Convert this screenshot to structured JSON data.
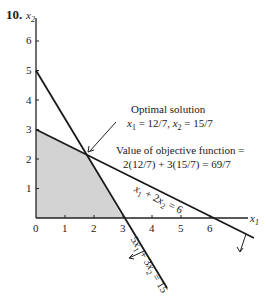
{
  "problem_number": "10.",
  "axes": {
    "x_label": "x1",
    "y_label": "x2",
    "x_ticks": [
      "0",
      "1",
      "2",
      "3",
      "4",
      "5",
      "6"
    ],
    "y_ticks": [
      "1",
      "2",
      "3",
      "4",
      "5",
      "6"
    ]
  },
  "annotations": {
    "optimal_title": "Optimal solution",
    "optimal_values": "x1 = 12/7, x2 = 15/7",
    "objective_line1": "Value of objective function =",
    "objective_line2": "2(12/7) + 3(15/7) = 69/7"
  },
  "constraints": [
    {
      "label": "x1 + 2x2 = 6",
      "x_intercept": 6,
      "y_intercept": 3
    },
    {
      "label": "5x1 + 3x2 = 15",
      "x_intercept": 3,
      "y_intercept": 5
    }
  ],
  "feasible_region": {
    "vertices": [
      [
        0,
        0
      ],
      [
        3,
        0
      ],
      [
        1.714,
        2.143
      ],
      [
        0,
        3
      ]
    ],
    "fill": "#d3d3d3"
  },
  "optimal_point": {
    "x1": 1.714,
    "x2": 2.143
  }
}
